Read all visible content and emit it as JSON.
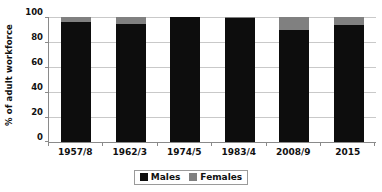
{
  "chart_data": {
    "type": "bar",
    "subtype": "stacked-bar-100-percent",
    "title": "",
    "xlabel": "",
    "ylabel": "% of adult workforce",
    "ylim": [
      0,
      100
    ],
    "yticks": [
      0,
      20,
      40,
      60,
      80,
      100
    ],
    "ytick_labels": [
      "0",
      "20",
      "40",
      "60",
      "80",
      "100"
    ],
    "grid": true,
    "legend_position": "bottom-center",
    "categories": [
      "1957/8",
      "1962/3",
      "1974/5",
      "1983/4",
      "2008/9",
      "2015"
    ],
    "series": [
      {
        "name": "Males",
        "color": "#0d0d0d",
        "values": [
          96,
          94.5,
          100,
          99,
          90,
          94
        ]
      },
      {
        "name": "Females",
        "color": "#808080",
        "values": [
          4,
          5.5,
          0,
          1,
          10,
          6
        ]
      }
    ]
  },
  "axes": {
    "y_title": "% of adult workforce",
    "y_tick_labels": [
      "100",
      "80",
      "60",
      "40",
      "20",
      "0"
    ],
    "x_tick_labels": [
      "1957/8",
      "1962/3",
      "1974/5",
      "1983/4",
      "2008/9",
      "2015"
    ]
  },
  "legend": {
    "entries": [
      {
        "label": "Males",
        "color": "#0d0d0d"
      },
      {
        "label": "Females",
        "color": "#808080"
      }
    ]
  },
  "colors": {
    "males": "#0d0d0d",
    "females": "#808080",
    "gridline": "#c9c9c9",
    "axis": "#8a8a8a",
    "background": "#ffffff",
    "text": "#111111"
  }
}
